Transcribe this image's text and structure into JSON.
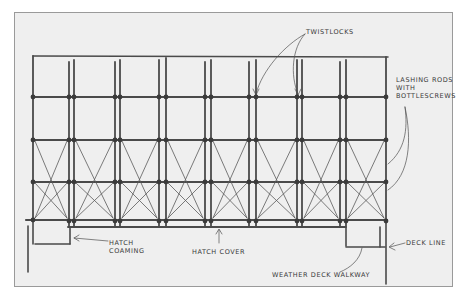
{
  "diagram": {
    "labels": {
      "twistlocks": "Twistlocks",
      "lashing_rods_line1": "Lashing rods",
      "lashing_rods_line2": "with",
      "lashing_rods_line3": "bottlescrews",
      "hatch_coaming_line1": "Hatch",
      "hatch_coaming_line2": "coaming",
      "hatch_cover": "Hatch cover",
      "deck_line": "Deck line",
      "weather_deck_walkway": "Weather deck walkway"
    },
    "colors": {
      "paper": "#efefef",
      "ink": "#4a4a4a",
      "frame": "#9a9a9a"
    },
    "structure": {
      "container_tiers": 4,
      "stack_columns": 8,
      "tier_lines_y": [
        56,
        97,
        140,
        182,
        221
      ],
      "stack_verticals_x": [
        33,
        69,
        74,
        115,
        120,
        159,
        166,
        205,
        211,
        249,
        256,
        297,
        302,
        340,
        346,
        386
      ]
    }
  }
}
